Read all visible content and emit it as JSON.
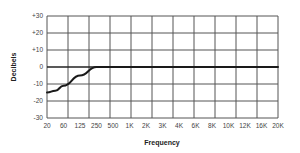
{
  "chart_data": {
    "type": "line",
    "title": "",
    "xlabel": "Frequency",
    "ylabel": "Decibels",
    "x_tick_labels": [
      "20",
      "60",
      "125",
      "250",
      "500",
      "1K",
      "2K",
      "3K",
      "4K",
      "6K",
      "8K",
      "10K",
      "12K",
      "16K",
      "20K"
    ],
    "y_tick_labels": [
      "+30",
      "+20",
      "+10",
      "0",
      "-10",
      "-20",
      "-30"
    ],
    "ylim": [
      -30,
      30
    ],
    "grid": true,
    "legend": null,
    "series": [
      {
        "name": "EQ response",
        "x": [
          "20",
          "40",
          "60",
          "125",
          "250",
          "500",
          "1K",
          "2K",
          "3K",
          "4K",
          "6K",
          "8K",
          "10K",
          "12K",
          "16K",
          "20K"
        ],
        "values": [
          -15,
          -14,
          -11,
          -5,
          0,
          0,
          0,
          0,
          0,
          0,
          0,
          0,
          0,
          0,
          0,
          0
        ]
      }
    ]
  },
  "colors": {
    "grid": "#555555",
    "zero_line": "#222222",
    "curve": "#1a1a1a",
    "text": "#444444"
  }
}
